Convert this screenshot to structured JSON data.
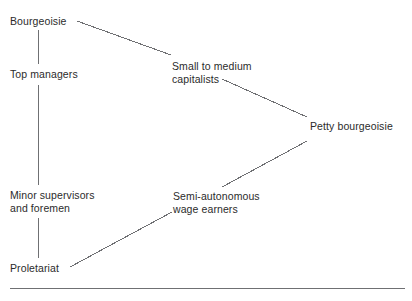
{
  "diagram": {
    "background_color": "#ffffff",
    "text_color": "#2b2b2b",
    "line_color": "#6f7073",
    "nodes": [
      {
        "id": "bourgeoisie",
        "label": "Bourgeoisie",
        "x": 10,
        "y": 15
      },
      {
        "id": "top-managers",
        "label": "Top managers",
        "x": 10,
        "y": 68
      },
      {
        "id": "small-to-medium-capitalists",
        "label": "Small to medium\ncapitalists",
        "x": 172,
        "y": 60
      },
      {
        "id": "petty-bourgeoisie",
        "label": "Petty bourgeoisie",
        "x": 310,
        "y": 120
      },
      {
        "id": "minor-supervisors-and-foremen",
        "label": "Minor supervisors\nand foremen",
        "x": 10,
        "y": 189
      },
      {
        "id": "semi-autonomous-wage-earners",
        "label": "Semi-autonomous\nwage earners",
        "x": 173,
        "y": 190
      },
      {
        "id": "proletariat",
        "label": "Proletariat",
        "x": 10,
        "y": 262
      }
    ],
    "edges": [
      {
        "id": "bourgeoisie-to-top-managers",
        "from": "bourgeoisie",
        "to": "top-managers",
        "x1": 38,
        "y1": 30,
        "x2": 38,
        "y2": 64
      },
      {
        "id": "bourgeoisie-to-small-to-medium-capitalists",
        "from": "bourgeoisie",
        "to": "small-to-medium-capitalists",
        "x1": 77,
        "y1": 21,
        "x2": 171,
        "y2": 55
      },
      {
        "id": "top-managers-to-minor-supervisors",
        "from": "top-managers",
        "to": "minor-supervisors-and-foremen",
        "x1": 38,
        "y1": 85,
        "x2": 38,
        "y2": 185
      },
      {
        "id": "small-to-medium-capitalists-to-petty-bourgeoisie",
        "from": "small-to-medium-capitalists",
        "to": "petty-bourgeoisie",
        "x1": 222,
        "y1": 79,
        "x2": 307,
        "y2": 117
      },
      {
        "id": "petty-bourgeoisie-to-semi-autonomous-wage-earners",
        "from": "petty-bourgeoisie",
        "to": "semi-autonomous-wage-earners",
        "x1": 307,
        "y1": 141,
        "x2": 222,
        "y2": 187
      },
      {
        "id": "minor-supervisors-to-proletariat",
        "from": "minor-supervisors-and-foremen",
        "to": "proletariat",
        "x1": 38,
        "y1": 218,
        "x2": 38,
        "y2": 258
      },
      {
        "id": "proletariat-to-semi-autonomous-wage-earners",
        "from": "proletariat",
        "to": "semi-autonomous-wage-earners",
        "x1": 70,
        "y1": 267,
        "x2": 172,
        "y2": 212
      }
    ],
    "footer_rule": {
      "id": "footer-rule",
      "x1": 10,
      "y1": 288,
      "x2": 405,
      "y2": 288
    }
  }
}
